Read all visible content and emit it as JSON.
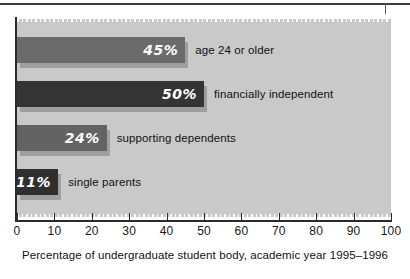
{
  "chart_data": {
    "type": "bar",
    "orientation": "horizontal",
    "title": "",
    "subtitle": "",
    "caption": "Percentage of undergraduate student body, academic year 1995–1996",
    "xlabel": "Percentage of undergraduate student body, academic year 1995–1996",
    "ylabel": "",
    "xlim": [
      0,
      100
    ],
    "xticks": [
      0,
      10,
      20,
      30,
      40,
      50,
      60,
      70,
      80,
      90,
      100
    ],
    "xticklabels": [
      "0",
      "10",
      "20",
      "30",
      "40",
      "50",
      "60",
      "70",
      "80",
      "90",
      "100"
    ],
    "grid": false,
    "legend": null,
    "categories": [
      "age 24 or older",
      "financially independent",
      "supporting dependents",
      "single parents"
    ],
    "values": [
      45,
      50,
      24,
      11
    ],
    "value_labels": [
      "45%",
      "50%",
      "24%",
      "11%"
    ],
    "bar_colors": [
      "#6b6b6b",
      "#343434",
      "#636363",
      "#2f2f2f"
    ],
    "panel_background": "#c9c9c9",
    "figure_background": "#ffffff",
    "bars": [
      {
        "label": "age 24 or older",
        "value": 45,
        "value_label": "45%",
        "color": "#6b6b6b"
      },
      {
        "label": "financially independent",
        "value": 50,
        "value_label": "50%",
        "color": "#343434"
      },
      {
        "label": "supporting dependents",
        "value": 24,
        "value_label": "24%",
        "color": "#636363"
      },
      {
        "label": "single parents",
        "value": 11,
        "value_label": "11%",
        "color": "#2f2f2f"
      }
    ]
  }
}
